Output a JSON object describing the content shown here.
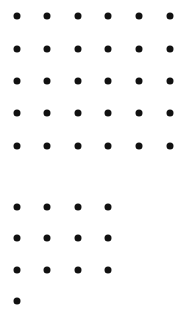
{
  "diagram": {
    "dot_color": "#111111",
    "groups": [
      {
        "name": "top-group",
        "rows": 5,
        "cols": 6,
        "count": 30,
        "row_y": [
          16,
          49,
          81,
          113,
          146
        ],
        "col_x": [
          17,
          47,
          78,
          108,
          139,
          170
        ],
        "row_counts": [
          6,
          6,
          6,
          6,
          6
        ]
      },
      {
        "name": "bottom-group",
        "rows": 4,
        "cols": 4,
        "count": 13,
        "row_y": [
          207,
          238,
          270,
          301
        ],
        "col_x": [
          17,
          47,
          78,
          108
        ],
        "row_counts": [
          4,
          4,
          4,
          1
        ]
      }
    ]
  }
}
